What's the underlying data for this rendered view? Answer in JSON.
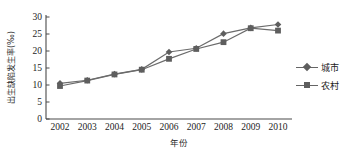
{
  "chart_data": {
    "type": "line",
    "title": "",
    "xlabel": "年份",
    "ylabel": "出生缺陷发生率(‰)",
    "categories": [
      "2002",
      "2003",
      "2004",
      "2005",
      "2006",
      "2007",
      "2008",
      "2009",
      "2010"
    ],
    "series": [
      {
        "name": "城市",
        "marker": "diamond",
        "color": "#5e5e5e",
        "values": [
          10.5,
          11.4,
          13.2,
          14.6,
          19.7,
          20.8,
          25.1,
          26.8,
          27.8
        ]
      },
      {
        "name": "农村",
        "marker": "square",
        "color": "#5e5e5e",
        "values": [
          9.7,
          11.3,
          13.1,
          14.5,
          17.7,
          20.6,
          22.6,
          26.7,
          26.0
        ]
      }
    ],
    "ylim": [
      0,
      30
    ],
    "yticks": [
      "0",
      "5",
      "10",
      "15",
      "20",
      "25",
      "30"
    ],
    "grid": false,
    "legend_position": "right",
    "axis_color": "#4a4a4a",
    "line_color": "#6b6b6b"
  },
  "legend": {
    "entries": [
      {
        "label": "城市",
        "marker": "diamond"
      },
      {
        "label": "农村",
        "marker": "square"
      }
    ]
  }
}
